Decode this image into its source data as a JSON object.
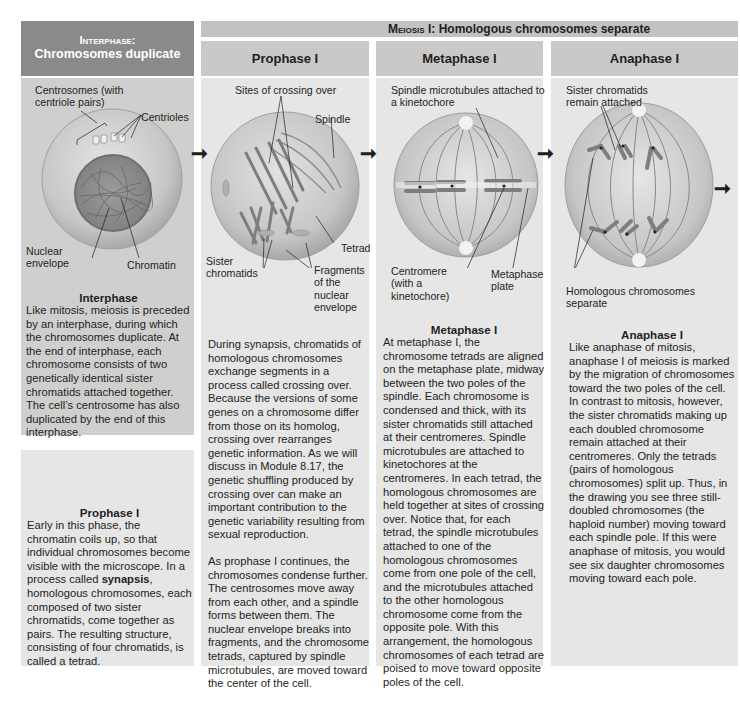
{
  "header": {
    "interphase_title_line1": "Interphase:",
    "interphase_title_line2": "Chromosomes duplicate",
    "meiosis_banner_prefix": "Meiosis",
    "meiosis_banner_suffix": " I: Homologous chromosomes separate"
  },
  "columns": [
    {
      "id": "interphase",
      "diagram_labels": [
        "Centrosomes (with centriole pairs)",
        "Centrioles",
        "Nuclear envelope",
        "Chromatin"
      ],
      "title": "Interphase",
      "text": "Like mitosis, meiosis is preceded by an interphase, during which the chromosomes duplicate. At the end of interphase, each chromosome consists of two genetically identical sister chromatids attached together. The cell’s centrosome has also duplicated by the end of this interphase."
    },
    {
      "id": "prophase1",
      "header": "Prophase I",
      "diagram_labels": [
        "Sites of crossing over",
        "Spindle",
        "Tetrad",
        "Sister chromatids",
        "Fragments of the nuclear envelope"
      ],
      "text_p1": "During synapsis, chromatids of homologous chromosomes exchange segments in a process called crossing over. Because the versions of some genes on a chromosome differ from those on its homolog, crossing over rearranges genetic information. As we will discuss in Module 8.17, the genetic shuffling produced by crossing over can make an important contribution to the genetic variability resulting from sexual reproduction.",
      "text_p2": "As prophase I continues, the chromosomes condense further. The centrosomes move away from each other, and a spindle forms between them. The nuclear envelope breaks into fragments, and the chromosome tetrads, captured by spindle microtubules, are moved toward the center of the cell."
    },
    {
      "id": "metaphase1",
      "header": "Metaphase I",
      "diagram_labels": [
        "Spindle microtubules attached to a kinetochore",
        "Centromere (with a kinetochore)",
        "Metaphase plate"
      ],
      "title": "Metaphase I",
      "text": "At metaphase I, the chromosome tetrads are aligned on the metaphase plate, midway between the two poles of the spindle. Each chromosome is condensed and thick, with its sister chromatids still attached at their centromeres. Spindle microtubules are attached to kinetochores at the centromeres. In each tetrad, the homologous chromosomes are held together at sites of crossing over. Notice that, for each tetrad, the spindle microtubules attached to one of the homologous chromosomes come from one pole of the cell, and the microtubules attached to the other homologous chromosome come from the opposite pole. With this arrangement, the homologous chromosomes of each tetrad are poised to move toward opposite poles of the cell."
    },
    {
      "id": "anaphase1",
      "header": "Anaphase I",
      "diagram_labels": [
        "Sister chromatids remain attached",
        "Homologous chromosomes separate"
      ],
      "title": "Anaphase I",
      "text": "Like anaphase of mitosis, anaphase I of meiosis is marked by the migration of chromosomes toward the two poles of the cell. In contrast to mitosis, however, the sister chromatids making up each doubled chromosome remain attached at their centromeres. Only the tetrads (pairs of homologous chromosomes) split up. Thus, in the drawing you see three still-doubled chromosomes (the haploid number) moving toward each spindle pole. If this were anaphase of mitosis, you would see six daughter chromosomes moving toward each pole."
    }
  ],
  "prophase_box": {
    "title": "Prophase I",
    "text_before": "Early in this phase, the chromatin coils up, so that individual chromosomes become visible with the microscope. In a process called ",
    "bold_term": "synapsis",
    "text_after": ", homologous chromosomes, each composed of two sister chromatids, come together as pairs. The resulting structure, consisting of four chromatids, is called a tetrad."
  },
  "arrows": [
    "right-arrow",
    "right-arrow",
    "right-arrow",
    "right-arrow"
  ],
  "colors": {
    "header_dark": "#8a8a8a",
    "header_light": "#c9c9c9",
    "panel": "#e6e6e6",
    "interphase_panel": "#cfcfcf",
    "cell_fill": "#c8c8c8",
    "cell_edge": "#9a9a9a"
  }
}
